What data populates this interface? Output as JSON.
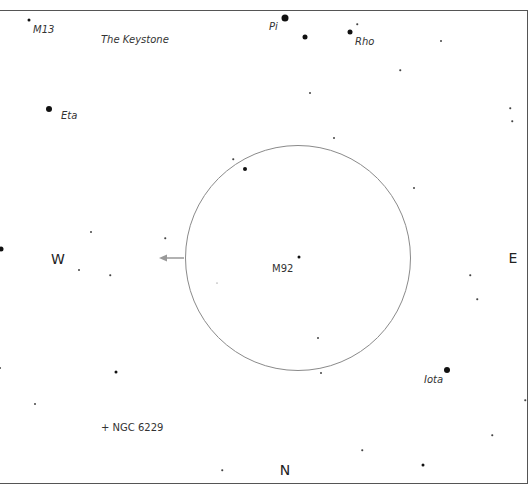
{
  "finder_chart": {
    "partial_header_text": "",
    "compass": {
      "west": "W",
      "east": "E",
      "north": "N"
    },
    "field_of_view": {
      "center_x": 298,
      "center_y": 258,
      "radius": 113,
      "color": "#8a8a8a"
    },
    "motion_arrow": {
      "from_x": 184,
      "to_x": 160,
      "y": 258,
      "color": "#999999"
    },
    "labels": {
      "m13": "M13",
      "keystone": "The Keystone",
      "pi": "Pi",
      "rho": "Rho",
      "eta": "Eta",
      "m92": "M92",
      "iota": "Iota",
      "ngc6229": "+ NGC 6229"
    },
    "stars": [
      {
        "name": "m13-star",
        "x": 29,
        "y": 20,
        "size": 3
      },
      {
        "name": "pi-star",
        "x": 285,
        "y": 18,
        "size": 7
      },
      {
        "name": "star",
        "x": 305,
        "y": 37,
        "size": 5
      },
      {
        "name": "rho-star",
        "x": 350,
        "y": 32,
        "size": 5
      },
      {
        "name": "eta-star",
        "x": 49,
        "y": 109,
        "size": 6
      },
      {
        "name": "star",
        "x": 245,
        "y": 169,
        "size": 4
      },
      {
        "name": "m92-star",
        "x": 299,
        "y": 257,
        "size": 3
      },
      {
        "name": "star",
        "x": 1,
        "y": 249,
        "size": 5
      },
      {
        "name": "iota-star",
        "x": 447,
        "y": 370,
        "size": 6
      },
      {
        "name": "star",
        "x": 116,
        "y": 372,
        "size": 3
      },
      {
        "name": "star",
        "x": 423,
        "y": 465,
        "size": 3
      },
      {
        "name": "star",
        "x": 441,
        "y": 41,
        "size": 2
      },
      {
        "name": "star",
        "x": 310,
        "y": 93,
        "size": 2
      },
      {
        "name": "star",
        "x": 334,
        "y": 138,
        "size": 2
      },
      {
        "name": "star",
        "x": 414,
        "y": 188,
        "size": 2
      },
      {
        "name": "star",
        "x": 233,
        "y": 159,
        "size": 1.5
      },
      {
        "name": "star",
        "x": 91,
        "y": 232,
        "size": 2
      },
      {
        "name": "star",
        "x": 79,
        "y": 270,
        "size": 2
      },
      {
        "name": "star",
        "x": 165,
        "y": 238,
        "size": 1.5
      },
      {
        "name": "star",
        "x": 110,
        "y": 275,
        "size": 1.5
      },
      {
        "name": "star",
        "x": 318,
        "y": 338,
        "size": 2
      },
      {
        "name": "star",
        "x": 321,
        "y": 373,
        "size": 2
      },
      {
        "name": "star",
        "x": 477,
        "y": 299,
        "size": 1.5
      },
      {
        "name": "star",
        "x": 35,
        "y": 404,
        "size": 2
      },
      {
        "name": "star",
        "x": 0,
        "y": 368,
        "size": 2
      },
      {
        "name": "star",
        "x": 222,
        "y": 470,
        "size": 1.5
      },
      {
        "name": "star",
        "x": 362,
        "y": 450,
        "size": 1.5
      },
      {
        "name": "star",
        "x": 510,
        "y": 108,
        "size": 1.5
      },
      {
        "name": "star",
        "x": 512,
        "y": 121,
        "size": 1.5
      },
      {
        "name": "star",
        "x": 492,
        "y": 435,
        "size": 1.5
      },
      {
        "name": "star",
        "x": 525,
        "y": 400,
        "size": 1.5
      },
      {
        "name": "star",
        "x": 357,
        "y": 24,
        "size": 1.5
      },
      {
        "name": "star",
        "x": 400,
        "y": 70,
        "size": 1.5
      },
      {
        "name": "star",
        "x": 470,
        "y": 275,
        "size": 1.5
      },
      {
        "name": "star",
        "x": 217,
        "y": 283,
        "size": 1
      }
    ]
  }
}
